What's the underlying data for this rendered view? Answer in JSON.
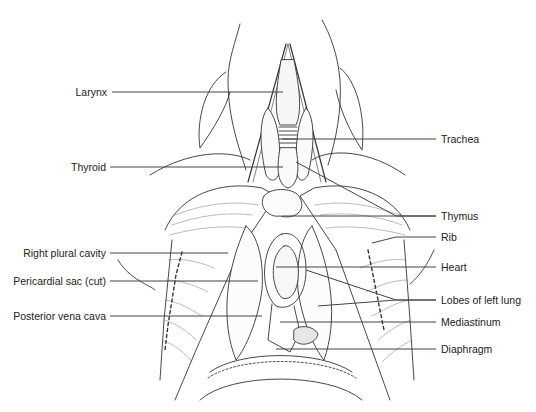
{
  "diagram": {
    "type": "labeled anatomical illustration",
    "line_color": "#444444",
    "text_color": "#222222",
    "labels_left": [
      {
        "id": "larynx",
        "text": "Larynx",
        "y": 92,
        "text_right": 107,
        "line_x1": 112,
        "line_x2": 283,
        "target_y": 92
      },
      {
        "id": "thyroid",
        "text": "Thyroid",
        "y": 167,
        "text_right": 106,
        "line_x1": 110,
        "line_x2": 283,
        "target_y": 167
      },
      {
        "id": "right-plural-cavity",
        "text": "Right plural cavity",
        "y": 253,
        "text_right": 106,
        "line_x1": 110,
        "line_x2": 228,
        "target_y": 253
      },
      {
        "id": "pericardial-sac",
        "text": "Pericardial sac (cut)",
        "y": 281,
        "text_right": 106,
        "line_x1": 110,
        "line_x2": 258,
        "target_y": 281
      },
      {
        "id": "posterior-vena-cava",
        "text": "Posterior vena cava",
        "y": 316,
        "text_right": 106,
        "line_x1": 110,
        "line_x2": 262,
        "target_y": 316
      }
    ],
    "labels_right": [
      {
        "id": "trachea",
        "text": "Trachea",
        "y": 139,
        "text_left": 441,
        "targets": [
          [
            282,
            139
          ]
        ]
      },
      {
        "id": "thymus",
        "text": "Thymus",
        "y": 216,
        "text_left": 441,
        "targets": [
          [
            282,
            216
          ],
          [
            296,
            162
          ]
        ]
      },
      {
        "id": "rib",
        "text": "Rib",
        "y": 237,
        "text_left": 441,
        "targets": [
          [
            372,
            243
          ]
        ]
      },
      {
        "id": "heart",
        "text": "Heart",
        "y": 267,
        "text_left": 441,
        "targets": [
          [
            276,
            267
          ]
        ]
      },
      {
        "id": "lobes-of-left-lung",
        "text": "Lobes of left lung",
        "y": 300,
        "text_left": 441,
        "targets": [
          [
            306,
            270
          ],
          [
            318,
            306
          ]
        ]
      },
      {
        "id": "mediastinum",
        "text": "Mediastinum",
        "y": 322,
        "text_left": 441,
        "targets": [
          [
            280,
            322
          ]
        ]
      },
      {
        "id": "diaphragm",
        "text": "Diaphragm",
        "y": 349,
        "text_left": 441,
        "targets": [
          [
            276,
            349
          ]
        ]
      }
    ]
  }
}
